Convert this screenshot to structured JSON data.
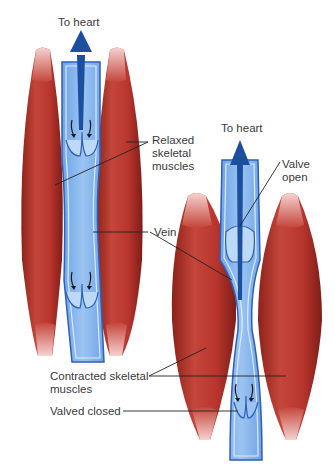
{
  "diagram": {
    "colors": {
      "muscle": "#b8352e",
      "muscle_dark": "#8e2219",
      "muscle_tendon": "#f2c4c2",
      "vein": "#7fb2ec",
      "vein_light": "#bcd9f7",
      "vein_edge": "#2f5fb8",
      "arrow": "#1e4f9e",
      "leader_line": "#222222",
      "text": "#3a3a3a"
    },
    "left_panel": {
      "state": "relaxed",
      "flow_label": "To heart",
      "labels": {
        "relaxed_muscles": "Relaxed\nskeletal\nmuscles",
        "vein": "Vein"
      }
    },
    "right_panel": {
      "state": "contracted",
      "flow_label": "To heart",
      "labels": {
        "valve_open": "Valve\nopen",
        "contracted_muscles": "Contracted skeletal\nmuscles",
        "valve_closed": "Valved closed"
      }
    }
  }
}
